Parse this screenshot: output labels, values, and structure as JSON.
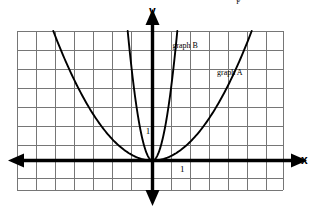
{
  "figure": {
    "axis_labels": {
      "x": "x",
      "y": "y"
    },
    "unit_marks": {
      "y_unit": "1",
      "x_unit": "1"
    },
    "curve_labels": {
      "graph_a": "graph A",
      "graph_b": "graph B"
    },
    "point_label": "F",
    "colors": {
      "background": "#ffffff",
      "grid": "#767676",
      "axis": "#000000",
      "curve": "#000000",
      "point": "#000000",
      "text": "#000000"
    }
  },
  "chart_data": {
    "type": "line",
    "xlabel": "x",
    "ylabel": "y",
    "xlim": [
      -7,
      7
    ],
    "ylim": [
      -1,
      8
    ],
    "grid": true,
    "grid_spacing": {
      "x": 1,
      "y": 1
    },
    "legend": "inline-annotations",
    "origin": {
      "x": 0,
      "y": 0
    },
    "series": [
      {
        "name": "graph A",
        "equation": "y = x^2 / 4",
        "coefficient": 0.25,
        "vertex": [
          0,
          0
        ],
        "opens": "up",
        "width": "wide",
        "label_position": [
          3.4,
          4.6
        ],
        "x": [
          -5.6,
          -5,
          -4.5,
          -4,
          -3.5,
          -3,
          -2.5,
          -2,
          -1.5,
          -1,
          -0.5,
          0,
          0.5,
          1,
          1.5,
          2,
          2.5,
          3,
          3.5,
          4,
          4.5,
          5,
          5.6
        ],
        "y": [
          7.84,
          6.25,
          5.06,
          4,
          3.06,
          2.25,
          1.56,
          1,
          0.56,
          0.25,
          0.06,
          0,
          0.06,
          0.25,
          0.56,
          1,
          1.56,
          2.25,
          3.06,
          4,
          5.06,
          6.25,
          7.84
        ]
      },
      {
        "name": "graph B",
        "equation": "y = 4x^2",
        "coefficient": 4,
        "vertex": [
          0,
          0
        ],
        "opens": "up",
        "width": "narrow",
        "label_position": [
          1.05,
          6.05
        ],
        "x": [
          -1.4,
          -1.25,
          -1,
          -0.875,
          -0.75,
          -0.625,
          -0.5,
          -0.375,
          -0.25,
          -0.125,
          0,
          0.125,
          0.25,
          0.375,
          0.5,
          0.625,
          0.75,
          0.875,
          1,
          1.25,
          1.4
        ],
        "y": [
          7.84,
          6.25,
          4,
          3.06,
          2.25,
          1.56,
          1,
          0.56,
          0.25,
          0.06,
          0,
          0.06,
          0.25,
          0.56,
          1,
          1.56,
          2.25,
          3.06,
          4,
          6.25,
          7.84
        ]
      }
    ],
    "points": [
      {
        "label": "F",
        "x": 4.25,
        "y": 8.7,
        "marker": "filled-circle"
      }
    ],
    "annotations": [
      {
        "text": "1",
        "x": -0.35,
        "y": 1.55,
        "role": "y-unit-mark"
      },
      {
        "text": "1",
        "x": 1.45,
        "y": -0.45,
        "role": "x-unit-mark"
      }
    ]
  }
}
